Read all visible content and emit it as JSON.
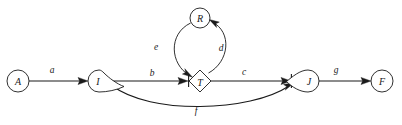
{
  "diagram": {
    "type": "activity-on-arrow-network-diagram",
    "background_color": "#ffffff",
    "line_color": "#1a1a1a",
    "nodes": [
      {
        "id": "A",
        "label": "A",
        "shape": "circle",
        "cx": 18,
        "cy": 81,
        "r": 11
      },
      {
        "id": "I",
        "label": "I",
        "shape": "teardrop-right",
        "cx": 99,
        "cy": 81,
        "r": 11
      },
      {
        "id": "R",
        "label": "R",
        "shape": "circle",
        "cx": 200,
        "cy": 18,
        "r": 10
      },
      {
        "id": "T",
        "label": "T",
        "shape": "diamond",
        "cx": 200,
        "cy": 81,
        "r": 11
      },
      {
        "id": "J",
        "label": "J",
        "shape": "teardrop-left",
        "cx": 307,
        "cy": 81,
        "r": 11
      },
      {
        "id": "F",
        "label": "F",
        "shape": "circle",
        "cx": 382,
        "cy": 81,
        "r": 11
      }
    ],
    "edges": [
      {
        "id": "a",
        "label": "a",
        "from": "A",
        "to": "I",
        "style": "straight",
        "label_x": 52,
        "label_y": 70
      },
      {
        "id": "b",
        "label": "b",
        "from": "I",
        "to": "T",
        "style": "straight",
        "label_x": 152,
        "label_y": 73
      },
      {
        "id": "c",
        "label": "c",
        "from": "T",
        "to": "J",
        "style": "straight",
        "label_x": 244,
        "label_y": 72
      },
      {
        "id": "d",
        "label": "d",
        "from": "T",
        "to": "R",
        "style": "curve-right",
        "label_x": 221,
        "label_y": 48
      },
      {
        "id": "e",
        "label": "e",
        "from": "R",
        "to": "T",
        "style": "curve-left",
        "label_x": 156,
        "label_y": 47
      },
      {
        "id": "f",
        "label": "f",
        "from": "I",
        "to": "J",
        "style": "curve-below",
        "label_x": 196,
        "label_y": 111
      },
      {
        "id": "g",
        "label": "g",
        "from": "J",
        "to": "F",
        "style": "straight",
        "label_x": 336,
        "label_y": 70
      }
    ]
  }
}
